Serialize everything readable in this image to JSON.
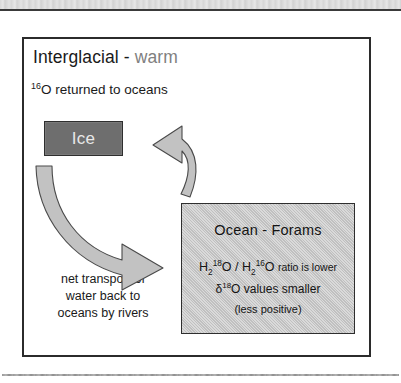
{
  "figure": {
    "heading": {
      "main_text": "Interglacial - ",
      "accent_text": "warm",
      "accent_color": "#808080"
    },
    "subtitle": {
      "superscript": "16",
      "text": "O returned to oceans"
    },
    "ice_box": {
      "label": "Ice",
      "fill_color": "#6e6e6e",
      "text_color": "#e8e8e8"
    },
    "ocean_box": {
      "title": "Ocean - Forams",
      "fill_color": "#c6c6c6",
      "formula": {
        "h1": "H",
        "h1_sub": "2",
        "h1_sup": "18",
        "h1_o": "O",
        "divider": " / ",
        "h2": "H",
        "h2_sub": "2",
        "h2_sup": "16",
        "h2_o": "O",
        "tail": "ratio is lower"
      },
      "delta_line": {
        "symbol": "δ",
        "superscript": "18",
        "text": "O values smaller"
      },
      "paren_line": "(less positive)"
    },
    "caption": {
      "line1": "net transport of",
      "line2": "water back to",
      "line3": "oceans by rivers"
    },
    "arrows": [
      {
        "name": "arrow-ocean-to-ice",
        "direction": "up-left",
        "fill_color": "#c2c2c2",
        "stroke_color": "#4a4a4a"
      },
      {
        "name": "arrow-ice-to-ocean",
        "direction": "down-right",
        "fill_color": "#c2c2c2",
        "stroke_color": "#4a4a4a"
      }
    ]
  }
}
